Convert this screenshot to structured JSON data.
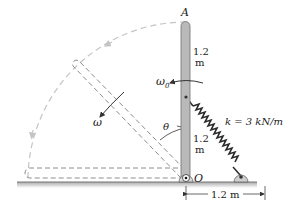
{
  "diagram": {
    "type": "mechanics-rotating-bar-with-spring",
    "labels": {
      "top_end": "A",
      "pivot": "O",
      "upper_length_value": "1.2",
      "upper_length_unit": "m",
      "lower_length_value": "1.2",
      "lower_length_unit": "m",
      "initial_angular_velocity": "ω",
      "initial_angular_velocity_sub": "0",
      "angular_velocity": "ω",
      "angle": "θ",
      "spring_constant": "k = 3 kN/m",
      "base_dimension": "1.2 m"
    },
    "colors": {
      "bar_fill": "#b9b9b9",
      "bar_edge": "#6f6f6f",
      "dashed": "#8c8c8c",
      "arc": "#c4c4c4",
      "spring": "#2a2a2a",
      "ground": "#9a9a9a",
      "text": "#1a1a1a"
    }
  }
}
